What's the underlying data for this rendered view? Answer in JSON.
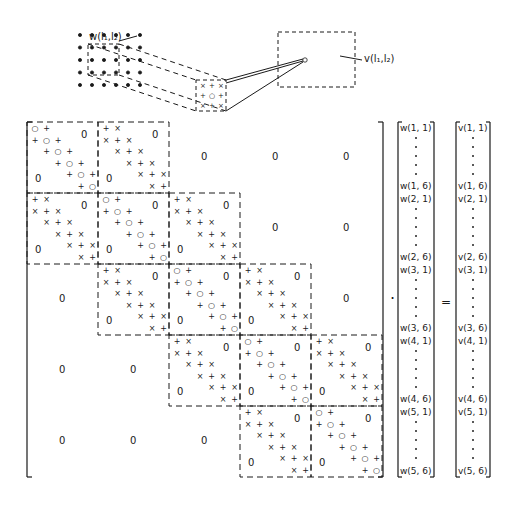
{
  "figure": {
    "top_diagram": {
      "input_grid": {
        "rows": 5,
        "cols": 6,
        "label": "w(l₁,l₂)"
      },
      "kernel_patch": {
        "rows": 3,
        "cols": 3,
        "symbols": [
          [
            "x",
            "+",
            "x"
          ],
          [
            "+",
            "o",
            "+"
          ],
          [
            "x",
            "+",
            "x"
          ]
        ]
      },
      "output_window": {
        "label": "v(l₁,l₂)"
      }
    },
    "matrix": {
      "block_rows": 5,
      "block_cols": 5,
      "block_size": 6,
      "zero_label": "0",
      "diagonal_block_pattern": {
        "main": "o",
        "off": "+"
      },
      "offdiagonal_block_pattern": {
        "main": "+",
        "off": "x"
      },
      "block_layout": [
        [
          "D",
          "O",
          "Z",
          "Z",
          "Z"
        ],
        [
          "O",
          "D",
          "O",
          "Z",
          "Z"
        ],
        [
          "Z",
          "O",
          "D",
          "O",
          "Z"
        ],
        [
          "Z",
          "Z",
          "O",
          "D",
          "O"
        ],
        [
          "Z",
          "Z",
          "Z",
          "O",
          "D"
        ]
      ]
    },
    "operators": {
      "multiply": "·",
      "equals": "="
    },
    "w_vector": [
      {
        "label": "w(1, 1)"
      },
      {
        "label": "w(1, 6)"
      },
      {
        "label": "w(2, 1)"
      },
      {
        "label": "w(2, 6)"
      },
      {
        "label": "w(3, 1)"
      },
      {
        "label": "w(3, 6)"
      },
      {
        "label": "w(4, 1)"
      },
      {
        "label": "w(4, 6)"
      },
      {
        "label": "w(5, 1)"
      },
      {
        "label": "w(5, 6)"
      }
    ],
    "v_vector": [
      {
        "label": "v(1, 1)"
      },
      {
        "label": "v(1, 6)"
      },
      {
        "label": "v(2, 1)"
      },
      {
        "label": "v(2, 6)"
      },
      {
        "label": "v(3, 1)"
      },
      {
        "label": "v(3, 6)"
      },
      {
        "label": "v(4, 1)"
      },
      {
        "label": "v(4, 6)"
      },
      {
        "label": "v(5, 1)"
      },
      {
        "label": "v(5, 6)"
      }
    ]
  }
}
